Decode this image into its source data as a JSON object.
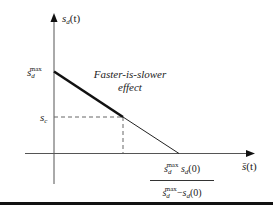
{
  "diagram": {
    "y_axis": {
      "label_main": "s",
      "label_sub": "d",
      "label_arg": "(t)"
    },
    "x_axis": {
      "label_main": "s̄",
      "label_arg": "(t)"
    },
    "y_tick_max": {
      "main": "s",
      "sub": "d",
      "sup": "max"
    },
    "y_tick_c": {
      "main": "s",
      "sub": "c"
    },
    "annotation": {
      "line1": "Faster-is-slower",
      "line2": "effect"
    },
    "x_intercept": {
      "numerator": {
        "t1": "s",
        "t1_sub": "d",
        "t1_sup": "max",
        "t2": " s",
        "t2_sub": "d",
        "t2_arg": "(0)"
      },
      "denominator": {
        "t1": "s",
        "t1_sub": "d",
        "t1_sup": "max",
        "minus": "−",
        "t2": "s",
        "t2_sub": "d",
        "t2_arg": "(0)"
      }
    },
    "colors": {
      "line": "#111111",
      "axis": "#555555",
      "dashed": "#666666",
      "rule": "#111111"
    }
  }
}
